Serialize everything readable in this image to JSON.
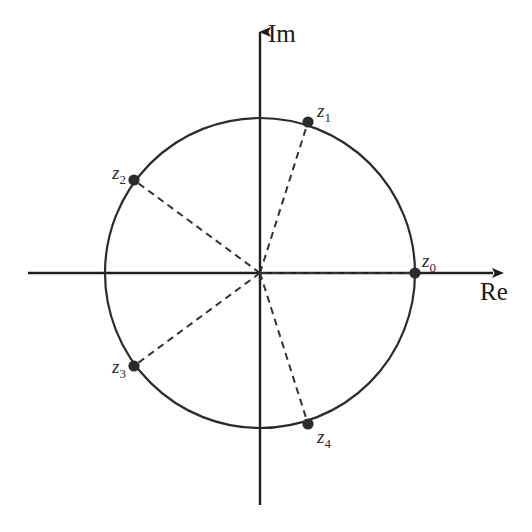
{
  "figure": {
    "background_color": "#ffffff",
    "stroke_color": "#2b2b2b",
    "point_color": "#2b2b2b",
    "dash_color": "#333333"
  },
  "axes": {
    "real": {
      "label": "Re",
      "label_x": 480,
      "label_y": 300,
      "x_start": 28,
      "x_end": 493,
      "y": 273,
      "arrow": "arrow-right"
    },
    "imaginary": {
      "label": "Im",
      "label_x": 268,
      "label_y": 42,
      "x": 260,
      "y_start": 32,
      "y_end": 505,
      "arrow": "arrow-up"
    }
  },
  "circle": {
    "center_x": 260,
    "center_y": 273,
    "radius": 155,
    "stroke_width": 2.2
  },
  "chart_data": {
    "type": "scatter",
    "xlabel": "Re",
    "ylabel": "Im",
    "xlim": [
      -1.5,
      1.5
    ],
    "ylim": [
      -1.5,
      1.5
    ],
    "grid": false,
    "legend": "none",
    "unit_circle": true,
    "points": [
      {
        "label": "z",
        "subscript": "0",
        "angle_deg": 0,
        "re": 1.0,
        "im": 0.0,
        "px": 415,
        "py": 273,
        "label_px": 422,
        "label_py": 267,
        "label_anchor": "start"
      },
      {
        "label": "z",
        "subscript": "1",
        "angle_deg": 72,
        "re": 0.309,
        "im": 0.951,
        "px": 308,
        "py": 122,
        "label_px": 317,
        "label_py": 117,
        "label_anchor": "start"
      },
      {
        "label": "z",
        "subscript": "2",
        "angle_deg": 144,
        "re": -0.809,
        "im": 0.588,
        "px": 134,
        "py": 180,
        "label_px": 126,
        "label_py": 179,
        "label_anchor": "end"
      },
      {
        "label": "z",
        "subscript": "3",
        "angle_deg": 216,
        "re": -0.809,
        "im": -0.588,
        "px": 134,
        "py": 366,
        "label_px": 126,
        "label_py": 373,
        "label_anchor": "end"
      },
      {
        "label": "z",
        "subscript": "4",
        "angle_deg": 288,
        "re": 0.309,
        "im": -0.951,
        "px": 308,
        "py": 424,
        "label_px": 317,
        "label_py": 443,
        "label_anchor": "start"
      }
    ],
    "radii_dashed": true,
    "dash_pattern": "7 5"
  }
}
